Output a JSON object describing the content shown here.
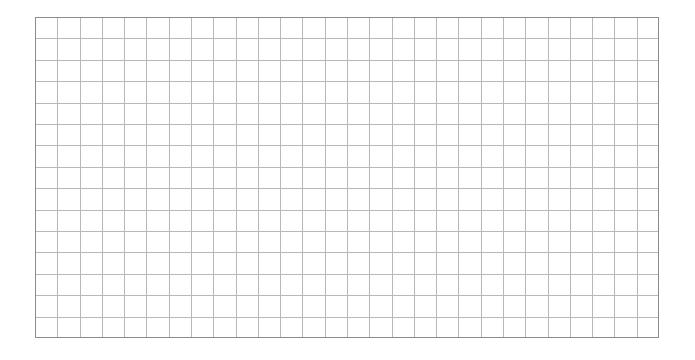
{
  "grid": {
    "columns": 28,
    "rows": 15,
    "line_color": "#b8b8b8",
    "border_color": "#8c8c8c",
    "background": "#ffffff"
  }
}
